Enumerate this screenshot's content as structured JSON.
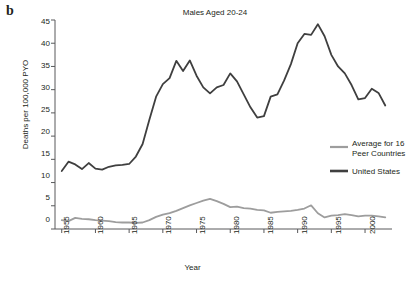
{
  "panel": {
    "label": "b"
  },
  "chart_data": {
    "type": "line",
    "title": "Males Aged 20-24",
    "xlabel": "Year",
    "ylabel": "Deaths per 100,000 PYO",
    "xlim": [
      1954,
      2004
    ],
    "ylim": [
      0,
      45
    ],
    "xticks": [
      1955,
      1960,
      1965,
      1970,
      1975,
      1980,
      1985,
      1990,
      1995,
      2000
    ],
    "yticks": [
      0,
      5,
      10,
      15,
      20,
      25,
      30,
      35,
      40,
      45
    ],
    "grid": false,
    "legend_position": "right",
    "colors": {
      "united_states": "#3f3f3f",
      "peer_countries": "#9d9d9d"
    },
    "x": [
      1955,
      1956,
      1957,
      1958,
      1959,
      1960,
      1961,
      1962,
      1963,
      1964,
      1965,
      1966,
      1967,
      1968,
      1969,
      1970,
      1971,
      1972,
      1973,
      1974,
      1975,
      1976,
      1977,
      1978,
      1979,
      1980,
      1981,
      1982,
      1983,
      1984,
      1985,
      1986,
      1987,
      1988,
      1989,
      1990,
      1991,
      1992,
      1993,
      1994,
      1995,
      1996,
      1997,
      1998,
      1999,
      2000,
      2001,
      2002,
      2003
    ],
    "series": [
      {
        "name": "United States",
        "color": "#3f3f3f",
        "values": [
          12.5,
          14.5,
          13.9,
          12.9,
          14.2,
          13.0,
          12.8,
          13.4,
          13.7,
          13.8,
          14.0,
          15.6,
          18.3,
          23.5,
          28.5,
          31.2,
          32.5,
          36.2,
          34.0,
          36.3,
          33.0,
          30.5,
          29.2,
          30.5,
          31.0,
          33.5,
          31.8,
          29.0,
          26.2,
          24.0,
          24.3,
          28.5,
          29.0,
          32.0,
          35.5,
          40.0,
          42.0,
          41.8,
          44.1,
          41.5,
          37.5,
          35.0,
          33.5,
          31.0,
          27.9,
          28.2,
          30.2,
          29.3,
          26.6
        ]
      },
      {
        "name": "Average for 16 Peer Countries",
        "color": "#9d9d9d",
        "values": [
          1.9,
          1.7,
          2.4,
          2.2,
          2.1,
          1.9,
          1.8,
          1.7,
          1.5,
          1.4,
          1.4,
          1.3,
          1.4,
          1.9,
          2.6,
          3.1,
          3.4,
          3.9,
          4.5,
          5.1,
          5.6,
          6.1,
          6.5,
          6.0,
          5.4,
          4.7,
          4.8,
          4.5,
          4.4,
          4.1,
          4.0,
          3.5,
          3.7,
          3.8,
          3.9,
          4.1,
          4.4,
          5.1,
          3.4,
          2.5,
          2.9,
          3.0,
          3.2,
          3.0,
          2.7,
          2.9,
          2.9,
          2.7,
          2.5
        ]
      }
    ]
  },
  "legend": {
    "items": [
      {
        "label_line1": "Average for 16",
        "label_line2": "Peer Countries",
        "color": "#9d9d9d"
      },
      {
        "label_line1": "United States",
        "label_line2": "",
        "color": "#3f3f3f"
      }
    ]
  },
  "ytick_labels": [
    "45",
    "40",
    "35",
    "30",
    "25",
    "20",
    "15",
    "10",
    "5",
    "0"
  ],
  "xtick_labels": [
    "1955",
    "1960",
    "1965",
    "1970",
    "1975",
    "1980",
    "1985",
    "1990",
    "1995",
    "2000"
  ]
}
